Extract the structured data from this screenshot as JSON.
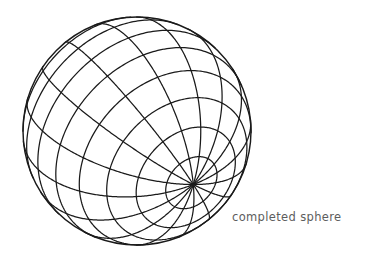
{
  "figure": {
    "title": "completed sphere",
    "caption": "completed sphere",
    "background_color": "#ffffff",
    "line_color": "#1a1a1a",
    "caption_color": "#5d5d5d",
    "line_width": 1.25
  },
  "chart_data": {
    "type": "diagram",
    "subtype": "wireframe-sphere",
    "title": "completed sphere",
    "center_x": 137,
    "center_y": 131,
    "radius": 114,
    "pole_x": 76,
    "pole_y": 62,
    "meridian_count": 16,
    "parallel_count": 11,
    "parallel_step_degrees": 15,
    "meridian_step_degrees": 22.5,
    "tilt_x_degrees": -62,
    "tilt_y_degrees": 34,
    "outline_drawn": true,
    "grid": "on",
    "legend": "none",
    "annotations": [
      {
        "text": "completed sphere",
        "x": 232,
        "y": 218
      }
    ]
  }
}
